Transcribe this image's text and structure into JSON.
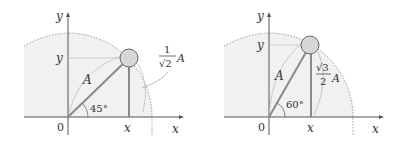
{
  "diagrams": [
    {
      "id": "left",
      "axis_x_label": "x",
      "axis_y_label": "y",
      "origin_label": "0",
      "proj_x_label": "x",
      "proj_y_label": "y",
      "radius_label": "A",
      "angle_label": "45°",
      "height_frac_num": "1",
      "height_frac_den": "√2",
      "height_frac_suffix": "A"
    },
    {
      "id": "right",
      "axis_x_label": "x",
      "axis_y_label": "y",
      "origin_label": "0",
      "proj_x_label": "x",
      "proj_y_label": "y",
      "radius_label": "A",
      "angle_label": "60°",
      "height_frac_num": "√3",
      "height_frac_den": "2",
      "height_frac_suffix": "A"
    }
  ],
  "colors": {
    "shade": "#f0f0f0",
    "axis": "#555555",
    "rod": "#8a8a8a",
    "dotted": "#999999"
  }
}
